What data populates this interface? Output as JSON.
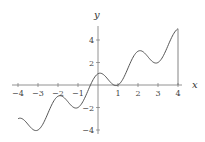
{
  "chart_data": {
    "type": "line",
    "title": "",
    "xlabel": "x",
    "ylabel": "y",
    "function": "y = x + cos(pi x)",
    "xlim": [
      -4,
      4
    ],
    "ylim": [
      -4,
      5
    ],
    "grid": false,
    "legend": null,
    "x_ticks": [
      -4,
      -3,
      -2,
      -1,
      1,
      2,
      3,
      4
    ],
    "y_ticks": [
      -4,
      -2,
      2,
      4
    ],
    "series": [
      {
        "name": "f(x)",
        "x": [
          -4,
          -3.5,
          -3,
          -2.5,
          -2,
          -1.5,
          -1,
          -0.5,
          0,
          0.5,
          1,
          1.5,
          2,
          2.5,
          3,
          3.5,
          4
        ],
        "values": [
          -3,
          -3.5,
          -4,
          -2.5,
          -1,
          -1.5,
          -2,
          -0.5,
          1,
          0.5,
          0,
          1.5,
          3,
          2.5,
          2,
          3.5,
          5
        ]
      }
    ],
    "annotations": [
      "vertical line from (4,0) to (4,5)"
    ],
    "color": "#555555"
  }
}
